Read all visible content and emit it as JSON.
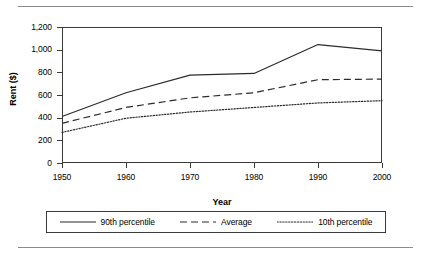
{
  "chart_data": {
    "type": "line",
    "title": "",
    "xlabel": "Year",
    "ylabel": "Rent ($)",
    "x": [
      1950,
      1960,
      1970,
      1980,
      1990,
      2000
    ],
    "xtick_labels": [
      "1950",
      "1960",
      "1970",
      "1980",
      "1990",
      "2000"
    ],
    "ytick_labels": [
      "1,200",
      "1,000",
      "800",
      "600",
      "400",
      "200",
      "0"
    ],
    "ytick_values": [
      1200,
      1000,
      800,
      600,
      400,
      200,
      0
    ],
    "xlim": [
      1950,
      2000
    ],
    "ylim": [
      0,
      1200
    ],
    "grid": false,
    "legend_position": "below-axes",
    "series": [
      {
        "name": "90th percentile",
        "style": "solid",
        "color": "#2b2b2b",
        "values": [
          410,
          620,
          775,
          790,
          1045,
          990
        ]
      },
      {
        "name": "Average",
        "style": "dashed",
        "color": "#2b2b2b",
        "values": [
          350,
          490,
          575,
          620,
          735,
          740
        ]
      },
      {
        "name": "10th percentile",
        "style": "dotted",
        "color": "#2b2b2b",
        "values": [
          270,
          395,
          450,
          490,
          530,
          550
        ]
      }
    ]
  },
  "colors": {
    "line": "#2b2b2b",
    "axis": "#3a3a3a",
    "rule": "#8a8a8a",
    "background": "#ffffff"
  }
}
